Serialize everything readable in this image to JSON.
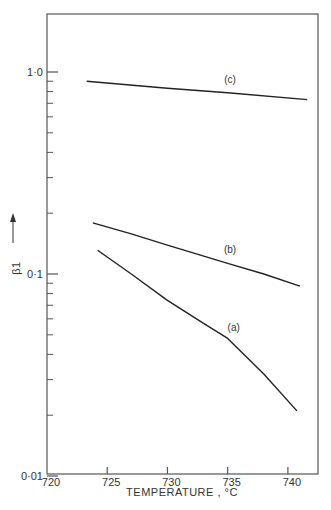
{
  "chart_data": {
    "type": "line",
    "title": "",
    "xlabel": "TEMPERATURE , °C",
    "ylabel": "β1",
    "yscale": "log",
    "xlim": [
      720,
      742.5
    ],
    "ylim": [
      0.01,
      2.0
    ],
    "x_ticks": [
      720,
      725,
      730,
      735,
      740
    ],
    "x_tick_labels": [
      "720",
      "725",
      "730",
      "735",
      "740"
    ],
    "y_major_ticks": [
      0.01,
      0.1,
      1.0
    ],
    "y_tick_labels": [
      "0·01",
      "0·1",
      "1·0"
    ],
    "grid": false,
    "legend": "inline curve labels",
    "series": [
      {
        "name": "(a)",
        "x": [
          724.2,
          727,
          730,
          733,
          735,
          738,
          740.75
        ],
        "y": [
          0.131,
          0.1,
          0.074,
          0.057,
          0.048,
          0.032,
          0.021
        ],
        "label_pos": [
          735.5,
          0.052
        ]
      },
      {
        "name": "(b)",
        "x": [
          723.8,
          727,
          730,
          735,
          738,
          741.0
        ],
        "y": [
          0.179,
          0.158,
          0.139,
          0.113,
          0.1,
          0.087
        ],
        "label_pos": [
          735.2,
          0.127
        ]
      },
      {
        "name": "(c)",
        "x": [
          723.3,
          730,
          735,
          741.6
        ],
        "y": [
          0.9,
          0.83,
          0.79,
          0.73
        ],
        "label_pos": [
          735.2,
          0.88
        ]
      }
    ]
  }
}
